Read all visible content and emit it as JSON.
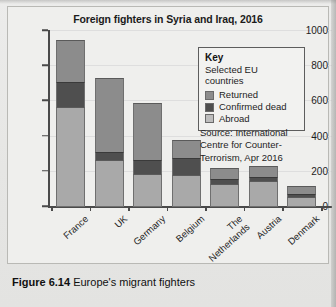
{
  "figure": {
    "caption_label": "Figure 6.14",
    "caption_text": "Europe's migrant fighters"
  },
  "chart_data": {
    "type": "bar",
    "subtype": "stacked",
    "title": "Foreign fighters in Syria and Iraq, 2016",
    "xlabel": "",
    "ylabel": "",
    "ylim": [
      0,
      1000
    ],
    "yticks": [
      0,
      200,
      400,
      600,
      800,
      1000
    ],
    "ytick_labels": [
      "0",
      "200",
      "400",
      "600",
      "800",
      "1000"
    ],
    "grid": true,
    "legend_position": "inside-top-right",
    "categories": [
      "France",
      "UK",
      "Germany",
      "Belgium",
      "The Netherlands",
      "Austria",
      "Denmark"
    ],
    "category_lines": [
      [
        "France"
      ],
      [
        "UK"
      ],
      [
        "Germany"
      ],
      [
        "Belgium"
      ],
      [
        "The",
        "Netherlands"
      ],
      [
        "Austria"
      ],
      [
        "Denmark"
      ]
    ],
    "series": [
      {
        "name": "Abroad",
        "color": "#a9a9a9",
        "values": [
          570,
          265,
          190,
          180,
          130,
          145,
          55
        ]
      },
      {
        "name": "Confirmed dead",
        "color": "#4f4f4f",
        "values": [
          140,
          45,
          75,
          100,
          30,
          25,
          20
        ]
      },
      {
        "name": "Returned",
        "color": "#8c8c8c",
        "values": [
          240,
          425,
          325,
          100,
          60,
          65,
          45
        ]
      }
    ],
    "totals": [
      950,
      735,
      590,
      380,
      220,
      235,
      120
    ],
    "legend": {
      "title": "Key",
      "subtitle": "Selected EU countries",
      "entries": [
        {
          "label": "Returned",
          "color": "#8c8c8c"
        },
        {
          "label": "Confirmed dead",
          "color": "#4f4f4f"
        },
        {
          "label": "Abroad",
          "color": "#bdbdbd"
        }
      ]
    },
    "source_note": "Source: International Centre for Counter-Terrorism, Apr 2016",
    "source_lines": [
      "Source: International",
      "Centre for Counter-",
      "Terrorism, Apr 2016"
    ]
  }
}
